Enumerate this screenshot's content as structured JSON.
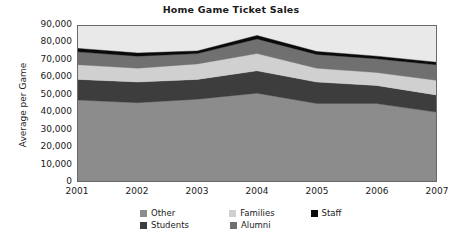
{
  "chart_data": {
    "type": "area",
    "title": "Home Game Ticket Sales",
    "xlabel": "",
    "ylabel": "Average per Game",
    "categories": [
      "2001",
      "2002",
      "2003",
      "2004",
      "2005",
      "2006",
      "2007"
    ],
    "x": [
      2001,
      2002,
      2003,
      2004,
      2005,
      2006,
      2007
    ],
    "ylim": [
      0,
      90000
    ],
    "yticks": [
      "0",
      "10,000",
      "20,000",
      "30,000",
      "40,000",
      "50,000",
      "60,000",
      "70,000",
      "80,000",
      "90,000"
    ],
    "ytick_values": [
      0,
      10000,
      20000,
      30000,
      40000,
      50000,
      60000,
      70000,
      80000,
      90000
    ],
    "grid": false,
    "stacked": true,
    "legend_position": "bottom",
    "series": [
      {
        "name": "Other",
        "color": "#8c8c8c",
        "values": [
          47000,
          45500,
          47500,
          51000,
          45000,
          45000,
          40000
        ]
      },
      {
        "name": "Students",
        "color": "#3d3d3d",
        "values": [
          12000,
          12000,
          11500,
          13000,
          12500,
          10500,
          10000
        ]
      },
      {
        "name": "Families",
        "color": "#d0d0d0",
        "values": [
          8500,
          8000,
          9000,
          10000,
          8000,
          7500,
          8500
        ]
      },
      {
        "name": "Alumni",
        "color": "#707070",
        "values": [
          7500,
          7000,
          6000,
          8500,
          8000,
          8000,
          9000
        ]
      },
      {
        "name": "Staff",
        "color": "#0a0a0a",
        "values": [
          2000,
          1800,
          1500,
          2000,
          1700,
          1500,
          1500
        ]
      }
    ],
    "totals": [
      77000,
      74300,
      75500,
      84500,
      75200,
      72500,
      69000
    ],
    "plot_background": "#e9e9e9",
    "axis_color": "#6a6a6a"
  },
  "legend": {
    "row1": [
      {
        "label": "Other",
        "color": "#8c8c8c"
      },
      {
        "label": "Families",
        "color": "#d0d0d0"
      },
      {
        "label": "Staff",
        "color": "#0a0a0a"
      }
    ],
    "row2": [
      {
        "label": "Students",
        "color": "#3d3d3d"
      },
      {
        "label": "Alumni",
        "color": "#707070"
      }
    ]
  }
}
